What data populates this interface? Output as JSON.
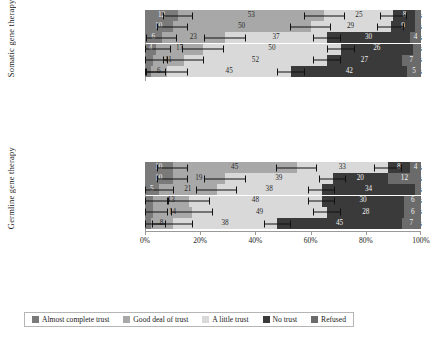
{
  "chart_data": {
    "type": "bar",
    "subtype": "stacked-horizontal-diverging-with-error-bars",
    "title": "",
    "xlabel": "",
    "ylabel": "",
    "xlim": [
      0,
      100
    ],
    "xticks": [
      0,
      20,
      40,
      60,
      80,
      100
    ],
    "xticklabels": [
      "0%",
      "20%",
      "40%",
      "60%",
      "80%",
      "100%"
    ],
    "grid": false,
    "legend_position": "bottom",
    "series": [
      {
        "name": "Almost complete trust",
        "color": "#7a7a7a"
      },
      {
        "name": "Good deal of trust",
        "color": "#a8a8a8"
      },
      {
        "name": "A little trust",
        "color": "#d9d9d9"
      },
      {
        "name": "No trust",
        "color": "#3a3a3a"
      },
      {
        "name": "Refused",
        "color": "#6b6b6b"
      }
    ],
    "panels": [
      {
        "group_label": "Somatic gene therapy",
        "categories": [
          "Doctors & medical experts",
          "Patients & families",
          "Spiritual or religious leaders",
          "Health care businesses",
          "Community forums",
          "Elected officials & policy makers"
        ],
        "values": [
          [
            12,
            53,
            25,
            8,
            2
          ],
          [
            10,
            50,
            29,
            9,
            2
          ],
          [
            6,
            23,
            37,
            30,
            4
          ],
          [
            4,
            17,
            50,
            26,
            3
          ],
          [
            3,
            11,
            52,
            27,
            7
          ],
          [
            2,
            6,
            45,
            42,
            5
          ]
        ]
      },
      {
        "group_label": "Germline gene therapy",
        "categories": [
          "Doctors & medical experts",
          "Individuals & families",
          "Spiritual or religious leaders",
          "Health care businesses",
          "Community forums",
          "Elected officials & policy makers"
        ],
        "values": [
          [
            10,
            45,
            33,
            8,
            4
          ],
          [
            10,
            19,
            39,
            20,
            12
          ],
          [
            5,
            21,
            38,
            34,
            2
          ],
          [
            3,
            13,
            48,
            30,
            6
          ],
          [
            3,
            14,
            49,
            28,
            6
          ],
          [
            2,
            8,
            38,
            45,
            7
          ]
        ]
      }
    ]
  },
  "legend": {
    "items": [
      {
        "label": "Almost complete trust",
        "color": "#7a7a7a"
      },
      {
        "label": "Good deal of trust",
        "color": "#a8a8a8"
      },
      {
        "label": "A little trust",
        "color": "#d9d9d9"
      },
      {
        "label": "No trust",
        "color": "#3a3a3a"
      },
      {
        "label": "Refused",
        "color": "#6b6b6b"
      }
    ]
  }
}
